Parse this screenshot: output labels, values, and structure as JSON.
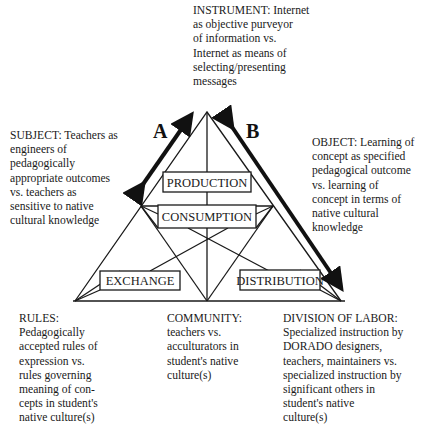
{
  "nodes": {
    "instrument": {
      "label": "INSTRUMENT: Internet\nas objective purveyor\nof information vs.\nInternet as means of\nselecting/presenting\nmessages"
    },
    "subject": {
      "label": "SUBJECT:  Teachers as\nengineers of\npedagogically\nappropriate outcomes\nvs. teachers as\nsensitive to native\ncultural knowledge"
    },
    "object": {
      "label": "OBJECT:  Learning of\nconcept as specified\npedagogical outcome\nvs. learning of\nconcept in terms of\nnative cultural\nknowledge"
    },
    "rules": {
      "label": "RULES:\nPedagogically\naccepted rules of\nexpression vs.\nrules governing\nmeaning of con-\ncepts in student's\nnative culture(s)"
    },
    "community": {
      "label": "COMMUNITY:\nteachers vs.\nacculturators in\nstudent's native\nculture(s)"
    },
    "division_of_labor": {
      "label": "DIVISION OF LABOR:\nSpecialized instruction by\nDORADO designers,\nteachers, maintainers vs.\nspecialized instruction by\nsignificant others in\nstudent's native\nculture(s)"
    }
  },
  "inner_boxes": {
    "production": "PRODUCTION",
    "consumption": "CONSUMPTION",
    "exchange": "EXCHANGE",
    "distribution": "DISTRIBUTION"
  },
  "arrows": {
    "a": {
      "label": "A",
      "type": "double-headed"
    },
    "b": {
      "label": "B",
      "type": "double-headed"
    }
  },
  "colors": {
    "line": "#1a1a1a",
    "background": "#ffffff"
  }
}
